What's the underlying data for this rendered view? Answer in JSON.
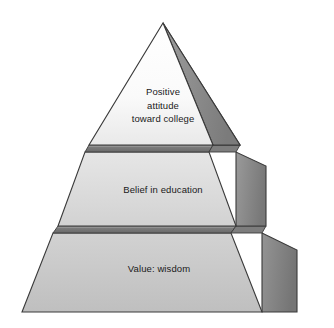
{
  "diagram": {
    "type": "pyramid",
    "title": "",
    "background_color": "#ffffff",
    "tier_count": 3,
    "tiers": [
      {
        "position": "top",
        "label": "Positive\nattitude\ntoward college",
        "lines": [
          "Positive",
          "attitude",
          "toward college"
        ],
        "front_face_color": "#fbfbfb",
        "side_face_color": "#8f8f8f"
      },
      {
        "position": "middle",
        "label": "Belief in education",
        "lines": [
          "Belief in education"
        ],
        "front_face_color": "#dcdcdc",
        "side_face_color": "#8a8a8a"
      },
      {
        "position": "bottom",
        "label": "Value: wisdom",
        "lines": [
          "Value: wisdom"
        ],
        "front_face_color": "#c6c6c6",
        "side_face_color": "#868686"
      }
    ],
    "colors": {
      "outline": "#3a3a3a",
      "divider_band": "#6e6e6e",
      "divider_band_highlight": "#b4b4b4",
      "text": "#1a1a1a",
      "side_dark": "#7e7e7e",
      "side_light": "#a5a5a5"
    },
    "geometry": {
      "apex": [
        163,
        23
      ],
      "front_bottom_left": [
        22,
        312
      ],
      "front_bottom_right": [
        262,
        312
      ],
      "side_bottom_right": [
        297,
        312
      ],
      "divider_1_y": 146,
      "divider_2_y": 227
    }
  }
}
